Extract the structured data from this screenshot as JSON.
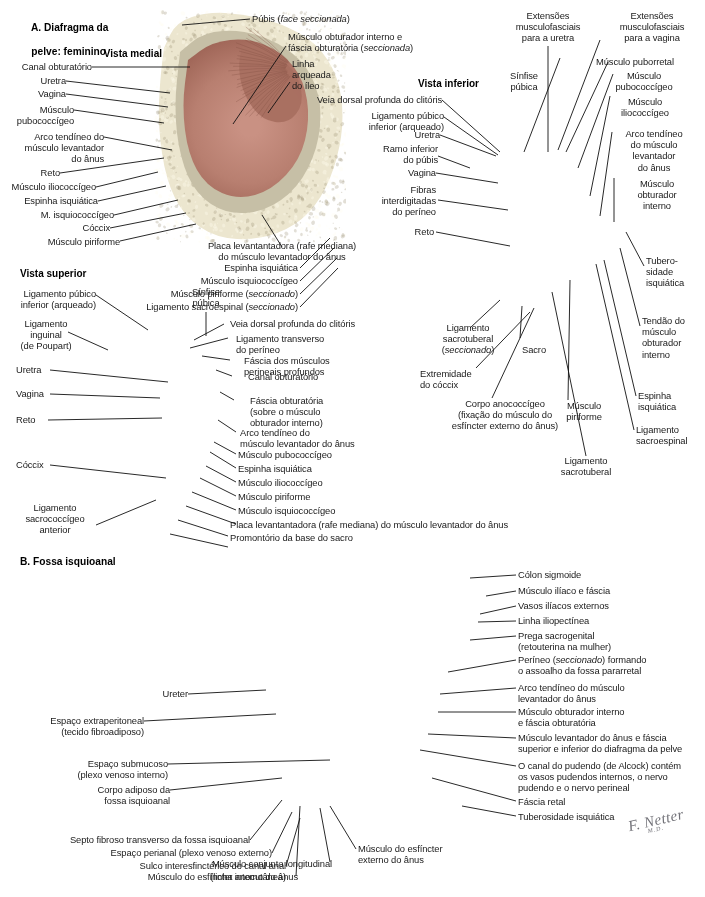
{
  "page": {
    "width": 705,
    "height": 897,
    "background": "#ffffff",
    "text_color": "#1a1a1a",
    "signature": "F. Netter",
    "signature_sub": "M.D."
  },
  "sections": {
    "a_title_line1": "A. Diafragma da",
    "a_title_line2": "pelve: feminino",
    "b_title": "B. Fossa isquioanal"
  },
  "views": {
    "medial": "Vista medial",
    "inferior": "Vista inferior",
    "superior": "Vista superior"
  },
  "figure_a_medial": {
    "labels_left": [
      "Canal obturatório",
      "Uretra",
      "Vagina",
      "Músculo\npubococcígeo",
      "Arco tendíneo do\nmúsculo levantador\ndo ânus",
      "Reto",
      "Músculo iliococcígeo",
      "Espinha isquiática",
      "M. isquiococcígeo",
      "Cóccix",
      "Músculo piriforme"
    ],
    "labels_top": [
      "Púbis (face seccionada)",
      "Músculo obturador interno e\nfáscia obturatória (seccionada)",
      "Linha\narqueada\ndo íleo"
    ],
    "labels_bottom": [
      "Placa levantantadora (rafe mediana)\ndo músculo levantador do ânus",
      "Espinha isquiática",
      "Músculo isquiococcígeo",
      "Músculo piriforme (seccionado)",
      "Ligamento sacroespinal (seccionado)"
    ]
  },
  "figure_a_inferior": {
    "labels_top": [
      "Extensões\nmusculofasciais\npara a uretra",
      "Extensões\nmusculofasciais\npara a vagina",
      "Sínfise\npúbica",
      "Músculo puborretal",
      "Músculo\npubococcígeo",
      "Músculo\niliococcígeo",
      "Arco tendíneo\ndo músculo\nlevantador\ndo ânus",
      "Músculo\nobturador\ninterno"
    ],
    "labels_left": [
      "Veia dorsal profunda do clitóris",
      "Ligamento púbico\ninferior (arqueado)",
      "Uretra",
      "Ramo inferior\ndo púbis",
      "Vagina",
      "Fibras\ninterdigitadas\ndo períneo",
      "Reto"
    ],
    "labels_right": [
      "Tubero-\nsidade\nisquiática",
      "Tendão do\nmúsculo\nobturador\ninterno",
      "Espinha\nisquiática",
      "Ligamento\nsacroespinal"
    ],
    "labels_bottom": [
      "Ligamento\nsacrotuberal\n(seccionado)",
      "Sacro",
      "Extremidade\ndo cóccix",
      "Corpo anococcígeo\n(fixação do músculo do\nesfíncter externo do ânus)",
      "Músculo\npiriforme",
      "Ligamento\nsacrotuberal"
    ]
  },
  "figure_a_superior": {
    "labels_left": [
      "Ligamento púbico\ninferior (arqueado)",
      "Ligamento\ninguinal\n(de Poupart)",
      "Uretra",
      "Vagina",
      "Reto",
      "Cóccix",
      "Ligamento\nsacrococcígeo\nanterior"
    ],
    "labels_top": [
      "Sínfise\npúbica"
    ],
    "labels_right": [
      "Veia dorsal profunda do clitóris",
      "Ligamento transverso\ndo períneo",
      "Fáscia dos músculos\nperineais profundos",
      "Canal obturatório",
      "Fáscia obturatória\n(sobre o músculo\nobturador interno)",
      "Arco tendíneo do\nmúsculo levantador do ânus",
      "Músculo pubococcígeo",
      "Espinha isquiática",
      "Músculo iliococcígeo",
      "Músculo piriforme",
      "Músculo isquiococcígeo",
      "Placa levantantadora (rafe mediana) do músculo levantador do ânus",
      "Promontório da base do sacro"
    ]
  },
  "figure_b": {
    "labels_left": [
      "Ureter",
      "Espaço extraperitoneal\n(tecido fibroadiposo)",
      "Espaço submucoso\n(plexo venoso interno)",
      "Corpo adiposo da\nfossa isquioanal",
      "Septo fibroso transverso da fossa isquioanal",
      "Espaço perianal (plexo venoso externo)",
      "Sulco interesfinctérico do canal anal\n(linha anocutânea)"
    ],
    "labels_right": [
      "Cólon sigmoide",
      "Músculo ilíaco e fáscia",
      "Vasos ilíacos externos",
      "Linha iliopectínea",
      "Prega sacrogenital\n(retouterina na mulher)",
      "Períneo (seccionado) formando\no assoalho da fossa pararretal",
      "Arco tendíneo do músculo\nlevantador do ânus",
      "Músculo obturador interno\ne fáscia obturatória",
      "Músculo levantador do ânus e fáscia\nsuperior e inferior do diafragma da pelve",
      "O canal do pudendo (de Alcock) contém\nos vasos pudendos internos, o nervo\npudendo e o nervo perineal",
      "Fáscia retal",
      "Tuberosidade isquiática"
    ],
    "labels_bottom": [
      "Músculo do esfíncter\nexterno do ânus",
      "Músculo conjunto longitudinal",
      "Músculo do esfíncter interno do ânus"
    ]
  },
  "palette": {
    "muscle": "#b9796e",
    "muscle_dark": "#8e5449",
    "muscle_light": "#cf9c90",
    "bone": "#d9d2b4",
    "bone_light": "#ece6cf",
    "fascia": "#c9cfc7",
    "fat": "#e4dc84",
    "fat_light": "#efe9a8",
    "bowel": "#c08d79",
    "bowel_light": "#d8ab95",
    "artery": "#c0504d",
    "vein": "#4a7eaa",
    "skin": "#e2cbb6",
    "line": "#111111"
  }
}
